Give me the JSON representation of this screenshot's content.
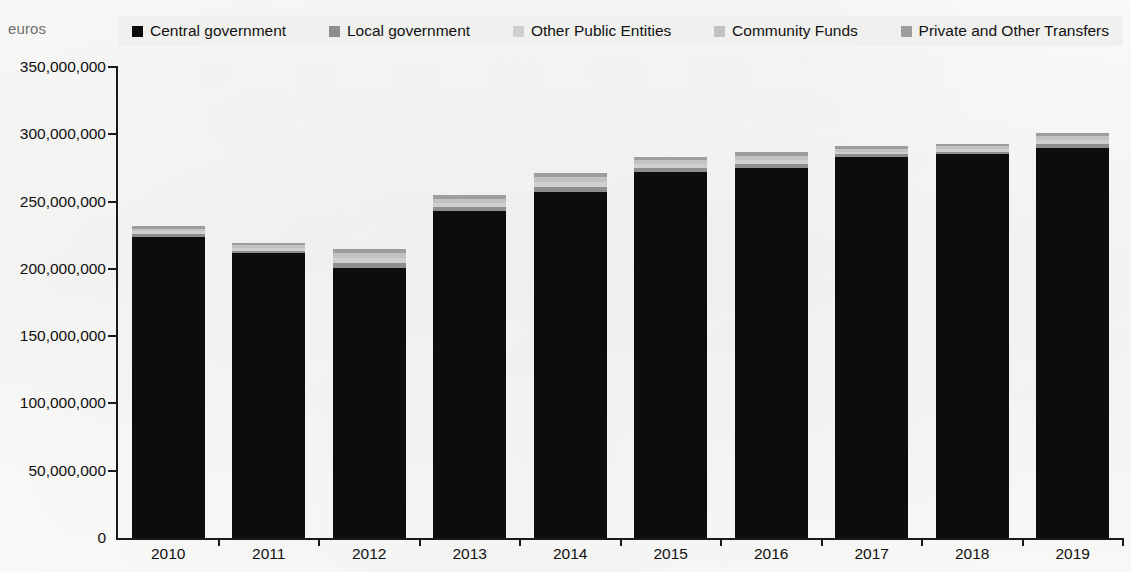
{
  "axis_unit": "euros",
  "legend": {
    "items": [
      {
        "label": "Central government",
        "color": "#0d0d0d"
      },
      {
        "label": "Local government",
        "color": "#8e8e8e"
      },
      {
        "label": "Other Public Entities",
        "color": "#cfcfcf"
      },
      {
        "label": "Community Funds",
        "color": "#c2c2c2"
      },
      {
        "label": "Private and Other Transfers",
        "color": "#9d9d9d"
      }
    ]
  },
  "chart_data": {
    "type": "bar",
    "stacked": true,
    "title": "",
    "subtitle": "",
    "xlabel": "",
    "ylabel": "euros",
    "ylim": [
      0,
      350000000
    ],
    "grid": false,
    "legend_position": "top",
    "categories": [
      "2010",
      "2011",
      "2012",
      "2013",
      "2014",
      "2015",
      "2016",
      "2017",
      "2018",
      "2019"
    ],
    "ytick_labels": [
      "0",
      "50,000,000",
      "100,000,000",
      "150,000,000",
      "200,000,000",
      "250,000,000",
      "300,000,000",
      "350,000,000"
    ],
    "ytick_values": [
      0,
      50000000,
      100000000,
      150000000,
      200000000,
      250000000,
      300000000,
      350000000
    ],
    "series": [
      {
        "name": "Central government",
        "color": "#0d0d0d",
        "values": [
          224000000,
          212000000,
          201000000,
          243000000,
          257000000,
          272000000,
          275000000,
          283000000,
          285000000,
          290000000
        ]
      },
      {
        "name": "Local government",
        "color": "#8e8e8e",
        "values": [
          2000000,
          1500000,
          3000000,
          3000000,
          3500000,
          3000000,
          3000000,
          2000000,
          2000000,
          2500000
        ]
      },
      {
        "name": "Other Public Entities",
        "color": "#cfcfcf",
        "values": [
          2000000,
          2000000,
          4000000,
          3000000,
          4000000,
          3000000,
          3000000,
          2000000,
          2000000,
          3000000
        ]
      },
      {
        "name": "Community Funds",
        "color": "#c2c2c2",
        "values": [
          2000000,
          2000000,
          4000000,
          3000000,
          3500000,
          3000000,
          3000000,
          2000000,
          2000000,
          3000000
        ]
      },
      {
        "name": "Private and Other Transfers",
        "color": "#9d9d9d",
        "values": [
          2000000,
          1500000,
          3000000,
          3000000,
          3000000,
          2000000,
          3000000,
          2000000,
          2000000,
          2500000
        ]
      }
    ],
    "totals": [
      232000000,
      219000000,
      215000000,
      255000000,
      271000000,
      283000000,
      287000000,
      291000000,
      293000000,
      301000000
    ]
  }
}
